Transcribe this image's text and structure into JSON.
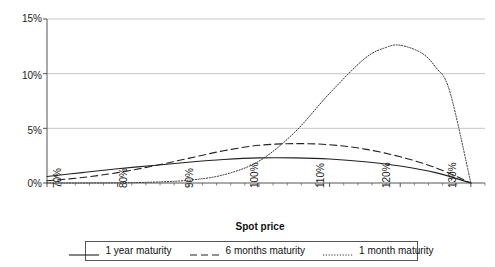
{
  "chart_data": {
    "type": "line",
    "title": "",
    "xlabel": "Spot price",
    "ylabel": "",
    "xlim": [
      70,
      132
    ],
    "ylim": [
      0,
      15
    ],
    "grid": true,
    "legend_position": "bottom",
    "y_ticks": [
      "0%",
      "5%",
      "10%",
      "15%"
    ],
    "y_tick_values": [
      0,
      5,
      10,
      15
    ],
    "x_ticks": [
      "70%",
      "80%",
      "90%",
      "100%",
      "110%",
      "120%",
      "130%"
    ],
    "x_tick_values": [
      70,
      80,
      90,
      100,
      110,
      120,
      130
    ],
    "series": [
      {
        "name": "1 year maturity",
        "style": "solid",
        "color": "#222222",
        "x": [
          70,
          75,
          80,
          85,
          90,
          95,
          100,
          105,
          110,
          115,
          120,
          125,
          130
        ],
        "values": [
          0.6,
          0.95,
          1.3,
          1.6,
          1.9,
          2.15,
          2.3,
          2.3,
          2.2,
          1.95,
          1.55,
          0.95,
          0.0
        ]
      },
      {
        "name": "6 months maturity",
        "style": "dashed",
        "color": "#222222",
        "x": [
          70,
          75,
          80,
          85,
          90,
          95,
          100,
          105,
          110,
          115,
          120,
          125,
          130
        ],
        "values": [
          0.2,
          0.5,
          0.95,
          1.55,
          2.25,
          2.95,
          3.45,
          3.6,
          3.5,
          3.1,
          2.4,
          1.4,
          0.0
        ]
      },
      {
        "name": "1 month maturity",
        "style": "dotted",
        "color": "#333333",
        "x": [
          70,
          75,
          80,
          85,
          90,
          95,
          100,
          105,
          110,
          115,
          118,
          120,
          123,
          125,
          127,
          130
        ],
        "values": [
          0.0,
          0.0,
          0.02,
          0.08,
          0.25,
          0.75,
          2.0,
          4.6,
          8.2,
          11.4,
          12.4,
          12.6,
          11.9,
          10.6,
          8.4,
          0.0
        ]
      }
    ]
  },
  "axis": {
    "x_title": "Spot price"
  },
  "legend": {
    "items": [
      {
        "label": "1 year maturity",
        "style": "solid"
      },
      {
        "label": "6 months maturity",
        "style": "dashed"
      },
      {
        "label": "1 month maturity",
        "style": "dotted"
      }
    ]
  },
  "colors": {
    "grid": "#b8b8b8",
    "axis": "#555555",
    "text": "#111111",
    "series": "#222222"
  }
}
